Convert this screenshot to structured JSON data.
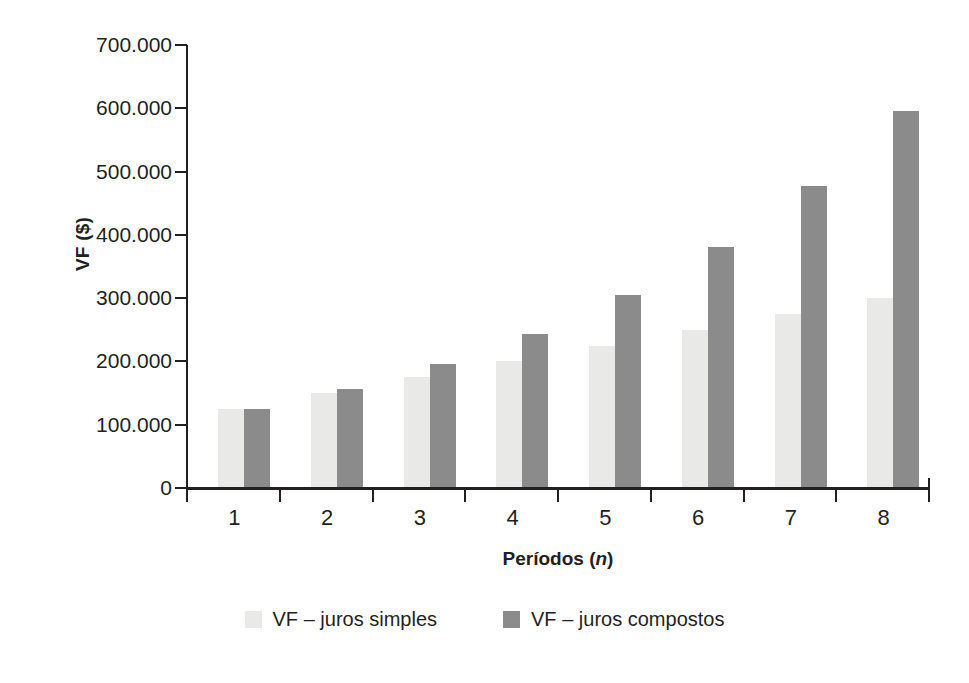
{
  "chart_data": {
    "type": "bar",
    "title": "",
    "xlabel": "Períodos (n)",
    "xlabel_plain": "Períodos",
    "xlabel_italic": "n",
    "ylabel": "VF ($)",
    "categories": [
      "1",
      "2",
      "3",
      "4",
      "5",
      "6",
      "7",
      "8"
    ],
    "ylim": [
      0,
      700000
    ],
    "ytick_labels": [
      "700.000",
      "600.000",
      "500.000",
      "400.000",
      "300.000",
      "200.000",
      "100.000",
      "0"
    ],
    "ytick_values": [
      700000,
      600000,
      500000,
      400000,
      300000,
      200000,
      100000,
      0
    ],
    "grid": false,
    "legend_position": "bottom",
    "series": [
      {
        "name": "VF – juros simples",
        "color": "#e9e9e7",
        "values": [
          125000,
          150000,
          175000,
          200000,
          225000,
          250000,
          275000,
          300000
        ]
      },
      {
        "name": "VF – juros compostos",
        "color": "#8b8b8b",
        "values": [
          125000,
          156250,
          195313,
          244141,
          305176,
          381470,
          476837,
          596046
        ]
      }
    ]
  },
  "axis": {
    "y_title": "VF ($)",
    "x_title_plain": "Períodos (",
    "x_title_italic": "n",
    "x_title_close": ")"
  },
  "colors": {
    "simple": "#e9e9e7",
    "compound": "#8b8b8b",
    "axis": "#231f20",
    "background": "#ffffff"
  }
}
